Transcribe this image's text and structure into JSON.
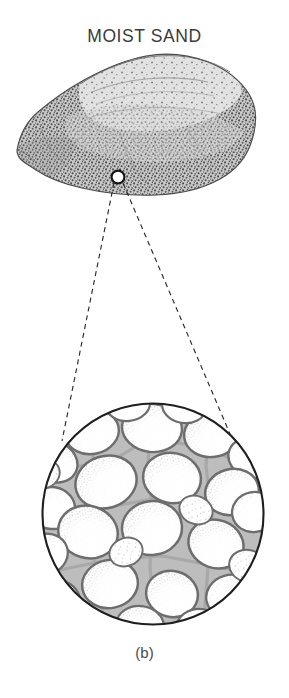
{
  "figure": {
    "title": "MOIST SAND",
    "caption": "(b)",
    "colors": {
      "background": "#ffffff",
      "title_text": "#3b3b3b",
      "caption_text": "#4a4a4a",
      "specimen_outline": "#4c4c4c",
      "specimen_stipple_dark": "#5a5a5a",
      "specimen_fill_light": "#d8d8d8",
      "specimen_fill_mid": "#b9b9b9",
      "callout_marker_stroke": "#1a1a1a",
      "leader_line": "#2b2b2b",
      "inset_circle_stroke": "#1e1e1e",
      "grain_outline": "#6d6d6d",
      "grain_fill": "#fdfdfd",
      "grain_stipple": "#585858",
      "pore_water_gray": "#b2b2b2",
      "pore_water_gray_dark": "#9a9a9a"
    },
    "specimen": {
      "label": "moist-sand-lump",
      "bounds": {
        "x": 15,
        "y": 52,
        "width": 242,
        "height": 144
      },
      "description": "irregular stippled lump of moist sand with lighter upper bedding surface"
    },
    "callout_marker": {
      "label": "magnification-point",
      "cx": 118,
      "cy": 177,
      "r": 6.5
    },
    "leader_lines": {
      "style": "dashed",
      "dash": "5 4",
      "left": {
        "x1": 114,
        "y1": 183,
        "x2": 62,
        "y2": 441
      },
      "right": {
        "x1": 123,
        "y1": 183,
        "x2": 233,
        "y2": 441
      }
    },
    "inset": {
      "label": "magnified-pore-structure",
      "cx": 153,
      "cy": 514,
      "r": 111,
      "description": "packed rounded sand grains separated by gray pore-water menisci",
      "grain_count": 29
    }
  }
}
